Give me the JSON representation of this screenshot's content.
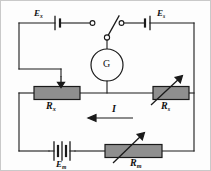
{
  "diagram": {
    "colors": {
      "wire": "#1a1a1a",
      "resistor_fill": "#8f8f8f",
      "resistor_stroke": "#1a1a1a",
      "background": "#fdfdfd",
      "frame": "#c9c9c9",
      "label": "#111111"
    },
    "labels": {
      "emf_unknown": {
        "base": "E",
        "sub": "x"
      },
      "emf_standard": {
        "base": "E",
        "sub": "s"
      },
      "emf_main": {
        "base": "E",
        "sub": "m"
      },
      "res_unknown": {
        "base": "R",
        "sub": "x"
      },
      "res_standard": {
        "base": "R",
        "sub": "s"
      },
      "res_main": {
        "base": "R",
        "sub": "m"
      },
      "galvanometer": "G",
      "current": "I"
    },
    "components": {
      "battery_left": "single-cell-battery",
      "battery_right": "single-cell-battery",
      "battery_bottom": "multi-cell-battery",
      "switch": "spdt-switch",
      "meter": "galvanometer",
      "resistor_left": "tapped-resistor",
      "resistor_right": "variable-resistor",
      "resistor_bottom": "variable-resistor",
      "current_arrow": "current-direction-arrow-left",
      "tap_arrow": "slider-tap-arrow-down"
    }
  }
}
